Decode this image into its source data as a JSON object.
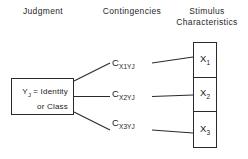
{
  "headers": {
    "judgment": "Judgment",
    "contingencies": "Contingencies",
    "stimulus_line1": "Stimulus",
    "stimulus_line2": "Characteristics"
  },
  "judgment_box": {
    "line1_main": "Y",
    "line1_sub": "J",
    "line1_rest": " = Identity",
    "line2": "or Class"
  },
  "contingencies": [
    {
      "symbol": "C",
      "sub_var": "X",
      "sub_index": "1",
      "sub_y": "Y",
      "sub_y_index": "J"
    },
    {
      "symbol": "C",
      "sub_var": "X",
      "sub_index": "2",
      "sub_y": "Y",
      "sub_y_index": "J"
    },
    {
      "symbol": "C",
      "sub_var": "X",
      "sub_index": "3",
      "sub_y": "Y",
      "sub_y_index": "J"
    }
  ],
  "stimulus_cells": [
    {
      "symbol": "X",
      "index": "1"
    },
    {
      "symbol": "X",
      "index": "2"
    },
    {
      "symbol": "X",
      "index": "3"
    }
  ],
  "colors": {
    "line": "#2a2a2a",
    "text": "#1a1a1a",
    "background": "#ffffff"
  }
}
